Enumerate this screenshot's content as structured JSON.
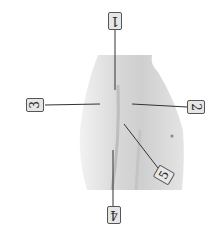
{
  "diagram": {
    "labels": [
      {
        "id": "1",
        "text": "1",
        "x": 110,
        "y": 12,
        "rotate": 180
      },
      {
        "id": "2",
        "text": "2",
        "x": 187,
        "y": 98,
        "rotate": 90
      },
      {
        "id": "3",
        "text": "3",
        "x": 28,
        "y": 96,
        "rotate": -90
      },
      {
        "id": "4",
        "text": "4",
        "x": 108,
        "y": 206,
        "rotate": 180
      },
      {
        "id": "5",
        "text": "5",
        "x": 157,
        "y": 168,
        "rotate": -60
      }
    ],
    "colors": {
      "background": "#ffffff",
      "skin": "#d9d9d9",
      "line": "#333333",
      "label_bg": "#e6e6e6"
    }
  }
}
